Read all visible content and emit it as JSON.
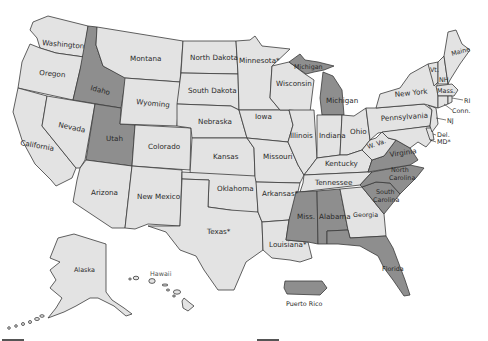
{
  "map": {
    "title": "",
    "colors": {
      "shaded": "#8e8e8e",
      "unshaded": "#e3e3e3",
      "border": "#3a3a3a",
      "background": "#ffffff"
    },
    "states": [
      {
        "id": "washington",
        "label": "Washington",
        "shaded": false
      },
      {
        "id": "oregon",
        "label": "Oregon",
        "shaded": false
      },
      {
        "id": "california",
        "label": "California",
        "shaded": false
      },
      {
        "id": "idaho",
        "label": "Idaho",
        "shaded": true
      },
      {
        "id": "nevada",
        "label": "Nevada",
        "shaded": false
      },
      {
        "id": "utah",
        "label": "Utah",
        "shaded": true
      },
      {
        "id": "arizona",
        "label": "Arizona",
        "shaded": false
      },
      {
        "id": "montana",
        "label": "Montana",
        "shaded": false
      },
      {
        "id": "wyoming",
        "label": "Wyoming",
        "shaded": false
      },
      {
        "id": "colorado",
        "label": "Colorado",
        "shaded": false
      },
      {
        "id": "new-mexico",
        "label": "New Mexico",
        "shaded": false
      },
      {
        "id": "north-dakota",
        "label": "North Dakota",
        "shaded": false
      },
      {
        "id": "south-dakota",
        "label": "South Dakota",
        "shaded": false
      },
      {
        "id": "nebraska",
        "label": "Nebraska",
        "shaded": false
      },
      {
        "id": "kansas",
        "label": "Kansas",
        "shaded": false
      },
      {
        "id": "oklahoma",
        "label": "Oklahoma",
        "shaded": false
      },
      {
        "id": "texas",
        "label": "Texas*",
        "shaded": false
      },
      {
        "id": "minnesota",
        "label": "Minnesota*",
        "shaded": false
      },
      {
        "id": "iowa",
        "label": "Iowa",
        "shaded": false
      },
      {
        "id": "missouri",
        "label": "Missouri",
        "shaded": false
      },
      {
        "id": "arkansas",
        "label": "Arkansas*",
        "shaded": false
      },
      {
        "id": "louisiana",
        "label": "Louisiana*",
        "shaded": false
      },
      {
        "id": "wisconsin",
        "label": "Wisconsin",
        "shaded": false
      },
      {
        "id": "illinois",
        "label": "Illinois",
        "shaded": false
      },
      {
        "id": "michigan-upper",
        "label": "Michigan",
        "shaded": true
      },
      {
        "id": "michigan-lower",
        "label": "Michigan",
        "shaded": true
      },
      {
        "id": "indiana",
        "label": "Indiana",
        "shaded": false
      },
      {
        "id": "ohio",
        "label": "Ohio",
        "shaded": false
      },
      {
        "id": "kentucky",
        "label": "Kentucky",
        "shaded": false
      },
      {
        "id": "tennessee",
        "label": "Tennessee",
        "shaded": false
      },
      {
        "id": "mississippi",
        "label": "Miss.",
        "shaded": true
      },
      {
        "id": "alabama",
        "label": "Alabama",
        "shaded": true
      },
      {
        "id": "georgia",
        "label": "Georgia",
        "shaded": false
      },
      {
        "id": "florida",
        "label": "Florida",
        "shaded": true
      },
      {
        "id": "south-carolina",
        "label": "South Carolina",
        "shaded": true
      },
      {
        "id": "north-carolina",
        "label": "North Carolina",
        "shaded": true
      },
      {
        "id": "virginia",
        "label": "Virginia",
        "shaded": true
      },
      {
        "id": "west-virginia",
        "label": "W. Va.",
        "shaded": false
      },
      {
        "id": "pennsylvania",
        "label": "Pennsylvania",
        "shaded": false
      },
      {
        "id": "new-york",
        "label": "New York",
        "shaded": false
      },
      {
        "id": "vermont",
        "label": "Vt.",
        "shaded": false
      },
      {
        "id": "new-hampshire",
        "label": "NH",
        "shaded": false
      },
      {
        "id": "maine",
        "label": "Maine",
        "shaded": false
      },
      {
        "id": "massachusetts",
        "label": "Mass.",
        "shaded": false
      },
      {
        "id": "rhode-island",
        "label": "RI",
        "shaded": false
      },
      {
        "id": "connecticut",
        "label": "Conn.",
        "shaded": false
      },
      {
        "id": "new-jersey",
        "label": "NJ",
        "shaded": false
      },
      {
        "id": "delaware",
        "label": "Del.",
        "shaded": false
      },
      {
        "id": "maryland",
        "label": "MD*",
        "shaded": false
      },
      {
        "id": "alaska",
        "label": "Alaska",
        "shaded": false
      },
      {
        "id": "hawaii",
        "label": "Hawaii",
        "shaded": false
      },
      {
        "id": "puerto-rico",
        "label": "Puerto Rico",
        "shaded": true
      }
    ]
  }
}
